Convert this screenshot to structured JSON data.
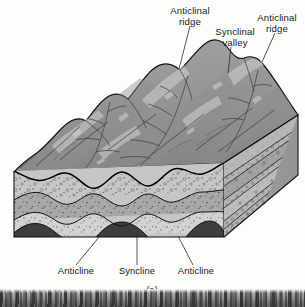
{
  "figure": {
    "caption": "(a)",
    "title_alt": "Block diagram of folded strata showing anticlinal ridges and synclinal valleys"
  },
  "labels": {
    "top": [
      {
        "id": "anticlinal-ridge-left",
        "line1": "Anticlinal",
        "line2": "ridge"
      },
      {
        "id": "synclinal-valley",
        "line1": "Synclinal",
        "line2": "valley"
      },
      {
        "id": "anticlinal-ridge-right",
        "line1": "Anticlinal",
        "line2": "ridge"
      }
    ],
    "bottom": [
      {
        "id": "anticline-left",
        "text": "Anticline"
      },
      {
        "id": "syncline-center",
        "text": "Syncline"
      },
      {
        "id": "anticline-right",
        "text": "Anticline"
      }
    ]
  },
  "colors": {
    "page_background": "#fdfdfc",
    "terrain_upper": "#9a9a9a",
    "terrain_lower": "#8a8a8a",
    "bed_light": "#c6c6c6",
    "bed_medium": "#a8a8a8",
    "bed_pale": "#d2d2d2",
    "bed_dark": "#3d3d3d",
    "side_face": "#9f9f9f",
    "outline": "#111111",
    "label_text": "#1a1a1a",
    "leader_line": "#2a2a2a"
  },
  "geology": {
    "structure_type": "plunging-free parallel folds",
    "fold_count_anticlines": 3,
    "fold_count_synclines": 2,
    "bed_units": [
      {
        "name": "uppermost eroded unit",
        "pattern": "massive gray"
      },
      {
        "name": "stippled conglomerate",
        "pattern": "circles-and-dots"
      },
      {
        "name": "medium sandstone",
        "pattern": "dots-and-dashes"
      },
      {
        "name": "pale siltstone",
        "pattern": "fine stipple"
      },
      {
        "name": "basal dark unit",
        "pattern": "solid dark"
      }
    ],
    "surface_features": [
      "eroded ridges",
      "dendritic drainage",
      "trellis valleys"
    ]
  }
}
